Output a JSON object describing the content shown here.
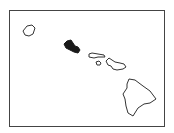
{
  "map": {
    "subject": "Hawaiian Islands",
    "highlighted_island": "Oahu",
    "colors": {
      "highlight": "#1a1a1a",
      "outline": "#333333",
      "background": "#ffffff",
      "frame": "#444444"
    },
    "islands": [
      {
        "name": "Kauai",
        "highlighted": false
      },
      {
        "name": "Oahu",
        "highlighted": true
      },
      {
        "name": "Molokai",
        "highlighted": false
      },
      {
        "name": "Lanai",
        "highlighted": false
      },
      {
        "name": "Maui",
        "highlighted": false
      },
      {
        "name": "Hawaii",
        "highlighted": false
      }
    ]
  }
}
